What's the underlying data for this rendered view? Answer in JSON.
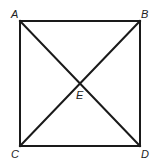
{
  "diagram": {
    "type": "square with diagonals",
    "points": {
      "A": {
        "label": "A"
      },
      "B": {
        "label": "B"
      },
      "C": {
        "label": "C"
      },
      "D": {
        "label": "D"
      },
      "E": {
        "label": "E"
      }
    },
    "segments": [
      "AB",
      "BD",
      "DC",
      "CA",
      "AD",
      "BC"
    ],
    "intersection": "E",
    "line_color": "#1a1a1a"
  }
}
